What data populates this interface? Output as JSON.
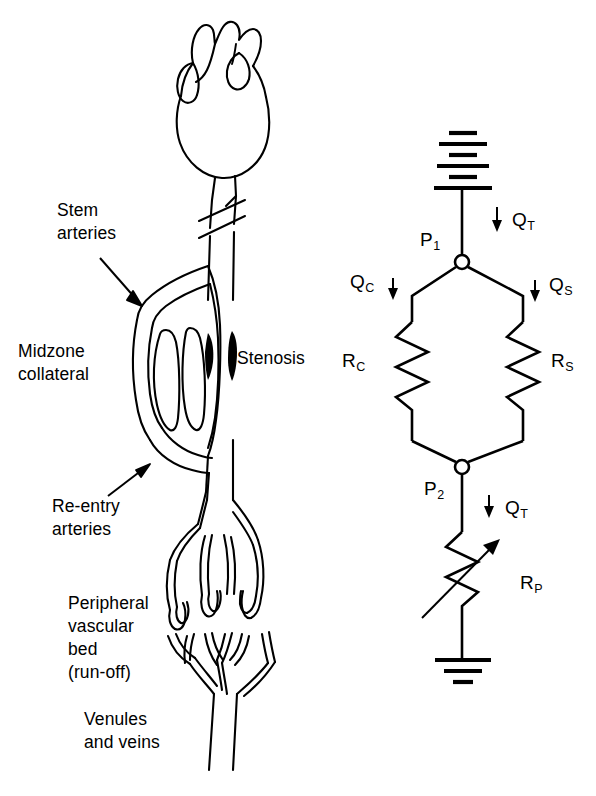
{
  "figure": {
    "ink_color": "#000000",
    "background_color": "#ffffff"
  },
  "anatomy": {
    "labels": {
      "stem_arteries": "Stem\narteries",
      "midzone_collateral": "Midzone\ncollateral",
      "stenosis": "Stenosis",
      "re_entry_arteries": "Re-entry\narteries",
      "peripheral_bed": "Peripheral\nvascular\nbed\n(run-off)",
      "venules_and_veins": "Venules\nand veins"
    },
    "structures": {
      "heart": "heart-outline",
      "vessel_break": "vessel-break-marks",
      "stenosis_marker": "stenosis-occlusion",
      "collateral_loop": "midzone-collateral-loop",
      "capillary_bed": "peripheral-vascular-bed"
    }
  },
  "circuit": {
    "nodes": [
      {
        "id": "P1",
        "label": "P",
        "subscript": "1"
      },
      {
        "id": "P2",
        "label": "P",
        "subscript": "2"
      }
    ],
    "flows": [
      {
        "id": "QT_top",
        "label": "Q",
        "subscript": "T",
        "arrow": "down",
        "arrow_side": "left"
      },
      {
        "id": "QC",
        "label": "Q",
        "subscript": "C",
        "arrow": "down",
        "arrow_side": "right"
      },
      {
        "id": "QS",
        "label": "Q",
        "subscript": "S",
        "arrow": "down",
        "arrow_side": "left"
      },
      {
        "id": "QT_bottom",
        "label": "Q",
        "subscript": "T",
        "arrow": "down",
        "arrow_side": "left"
      }
    ],
    "resistors": [
      {
        "id": "RC",
        "label": "R",
        "subscript": "C",
        "type": "fixed",
        "branch": "collateral"
      },
      {
        "id": "RS",
        "label": "R",
        "subscript": "S",
        "type": "fixed",
        "branch": "stenosis"
      },
      {
        "id": "RP",
        "label": "R",
        "subscript": "P",
        "type": "variable",
        "branch": "peripheral"
      }
    ],
    "terminals": {
      "source": "battery-cell-stack",
      "source_bars": 6,
      "ground": "earth-ground",
      "ground_bars": 3
    }
  }
}
